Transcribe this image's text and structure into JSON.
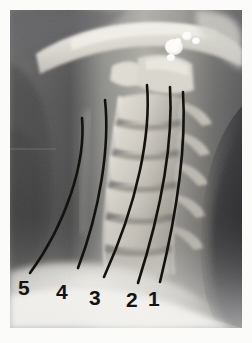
{
  "image": {
    "kind": "radiograph",
    "modality": "x-ray",
    "view": "lateral",
    "body_region": "cervical-spine",
    "border_color": "#ffffff",
    "film_bounds": {
      "x": 10,
      "y": 10,
      "width": 232,
      "height": 318
    }
  },
  "annotations": {
    "marker_color": "#14120f",
    "label_color": "#15130f",
    "labels": [
      {
        "id": "label-1",
        "text": "1"
      },
      {
        "id": "label-2",
        "text": "2"
      },
      {
        "id": "label-3",
        "text": "3"
      },
      {
        "id": "label-4",
        "text": "4"
      },
      {
        "id": "label-5",
        "text": "5"
      }
    ],
    "curves": [
      {
        "id": "curve-1",
        "label": "1",
        "top": [
          183,
          92
        ],
        "bottom": [
          152,
          285
        ]
      },
      {
        "id": "curve-2",
        "label": "2",
        "top": [
          170,
          87
        ],
        "bottom": [
          138,
          283
        ]
      },
      {
        "id": "curve-3",
        "label": "3",
        "top": [
          147,
          85
        ],
        "bottom": [
          104,
          277
        ]
      },
      {
        "id": "curve-4",
        "label": "4",
        "top": [
          105,
          100
        ],
        "bottom": [
          78,
          268
        ]
      },
      {
        "id": "curve-5",
        "label": "5",
        "top": [
          82,
          118
        ],
        "bottom": [
          30,
          273
        ]
      }
    ]
  },
  "palette": {
    "soft_tissue_dark": "#4c4c4c",
    "soft_tissue_mid": "#8a8a8a",
    "bone_light": "#c8c6c0",
    "bone_bright": "#e9e7e0",
    "metal_white": "#ffffff",
    "air_dark": "#3a3a3a"
  }
}
